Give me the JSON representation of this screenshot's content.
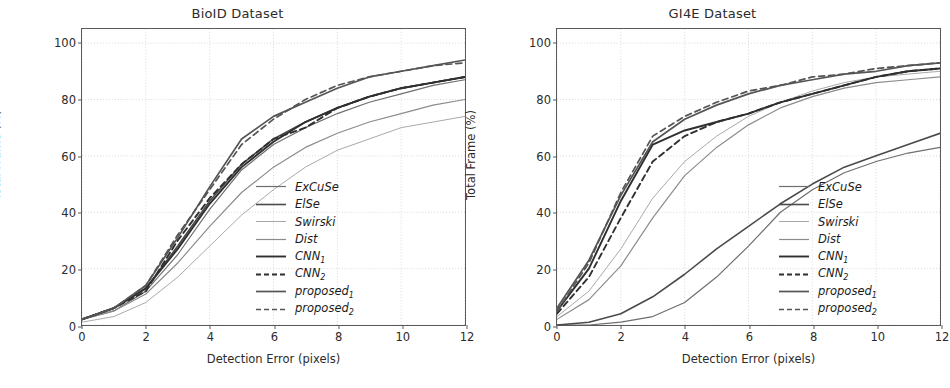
{
  "figure": {
    "width": 950,
    "height": 388,
    "background": "#ffffff"
  },
  "axis": {
    "xlabel": "Detection Error (pixels)",
    "ylabel": "Total Frame (%)",
    "xticks": [
      0,
      2,
      4,
      6,
      8,
      10,
      12
    ],
    "yticks": [
      0,
      20,
      40,
      60,
      80,
      100
    ],
    "xlim": [
      0,
      12
    ],
    "ylim": [
      0,
      105
    ],
    "grid": true,
    "grid_color": "#cfcfcf",
    "axis_color": "#5a5a5a",
    "text_color": "#2b2b2b"
  },
  "legend": {
    "position": "lower right",
    "entries": [
      {
        "label": "ExCuSe",
        "sub": "",
        "style": "solid",
        "color": "#6e6e6e",
        "width": 1.2
      },
      {
        "label": "ElSe",
        "sub": "",
        "style": "solid",
        "color": "#4a4a4a",
        "width": 1.6
      },
      {
        "label": "Swirski",
        "sub": "",
        "style": "solid",
        "color": "#a8a8a8",
        "width": 1.0
      },
      {
        "label": "Dist",
        "sub": "",
        "style": "solid",
        "color": "#8c8c8c",
        "width": 1.2
      },
      {
        "label": "CNN",
        "sub": "1",
        "style": "solid",
        "color": "#2f2f2f",
        "width": 1.9
      },
      {
        "label": "CNN",
        "sub": "2",
        "style": "dashed",
        "color": "#2f2f2f",
        "width": 1.9
      },
      {
        "label": "proposed",
        "sub": "1",
        "style": "solid",
        "color": "#555555",
        "width": 1.7
      },
      {
        "label": "proposed",
        "sub": "2",
        "style": "dashed",
        "color": "#555555",
        "width": 1.7
      }
    ]
  },
  "chart_data": [
    {
      "type": "line",
      "title": "BioID Dataset",
      "xlabel": "Detection Error (pixels)",
      "ylabel": "Total Frame (%)",
      "xlim": [
        0,
        12
      ],
      "ylim": [
        0,
        105
      ],
      "grid": true,
      "legend_position": "lower right",
      "x": [
        0,
        1,
        2,
        3,
        4,
        5,
        6,
        7,
        8,
        9,
        10,
        11,
        12
      ],
      "series": [
        {
          "name": "ExCuSe",
          "values": [
            2,
            5,
            12,
            25,
            41,
            55,
            64,
            70,
            75,
            79,
            82,
            85,
            87
          ]
        },
        {
          "name": "ElSe",
          "values": [
            2,
            6,
            13,
            28,
            44,
            57,
            66,
            72,
            77,
            81,
            84,
            86,
            88
          ]
        },
        {
          "name": "Swirski",
          "values": [
            1,
            3,
            8,
            17,
            28,
            39,
            48,
            56,
            62,
            66,
            70,
            72,
            74
          ]
        },
        {
          "name": "Dist",
          "values": [
            2,
            5,
            11,
            22,
            35,
            47,
            56,
            63,
            68,
            72,
            75,
            78,
            80
          ]
        },
        {
          "name": "CNN1",
          "values": [
            2,
            6,
            13,
            27,
            43,
            56,
            65,
            72,
            77,
            81,
            84,
            86,
            88
          ]
        },
        {
          "name": "CNN2",
          "values": [
            2,
            6,
            12,
            30,
            45,
            57,
            66,
            70,
            77,
            81,
            84,
            86,
            88
          ]
        },
        {
          "name": "proposed1",
          "values": [
            2,
            6,
            14,
            31,
            49,
            66,
            74,
            79,
            84,
            88,
            90,
            92,
            94
          ]
        },
        {
          "name": "proposed2",
          "values": [
            2,
            6,
            14,
            32,
            48,
            64,
            73,
            80,
            85,
            88,
            90,
            92,
            93
          ]
        }
      ]
    },
    {
      "type": "line",
      "title": "GI4E Dataset",
      "xlabel": "Detection Error (pixels)",
      "ylabel": "Total Frame (%)",
      "xlim": [
        0,
        12
      ],
      "ylim": [
        0,
        105
      ],
      "grid": true,
      "legend_position": "lower right",
      "x": [
        0,
        1,
        2,
        3,
        4,
        5,
        6,
        7,
        8,
        9,
        10,
        11,
        12
      ],
      "series": [
        {
          "name": "ExCuSe",
          "values": [
            0,
            0,
            1,
            3,
            8,
            17,
            28,
            40,
            48,
            54,
            58,
            61,
            63
          ]
        },
        {
          "name": "ElSe",
          "values": [
            0,
            1,
            4,
            10,
            18,
            27,
            35,
            43,
            50,
            56,
            60,
            64,
            68
          ]
        },
        {
          "name": "Swirski",
          "values": [
            3,
            12,
            27,
            45,
            58,
            67,
            74,
            79,
            83,
            86,
            88,
            89,
            90
          ]
        },
        {
          "name": "Dist",
          "values": [
            2,
            9,
            21,
            38,
            53,
            63,
            71,
            77,
            81,
            84,
            86,
            87,
            88
          ]
        },
        {
          "name": "CNN1",
          "values": [
            5,
            20,
            44,
            64,
            69,
            72,
            75,
            79,
            82,
            85,
            88,
            90,
            91
          ]
        },
        {
          "name": "CNN2",
          "values": [
            4,
            17,
            38,
            58,
            67,
            72,
            75,
            79,
            82,
            85,
            88,
            90,
            91
          ]
        },
        {
          "name": "proposed1",
          "values": [
            6,
            23,
            46,
            65,
            73,
            78,
            82,
            85,
            87,
            89,
            90,
            92,
            93
          ]
        },
        {
          "name": "proposed2",
          "values": [
            5,
            22,
            47,
            67,
            74,
            79,
            83,
            85,
            88,
            89,
            91,
            92,
            93
          ]
        }
      ]
    }
  ]
}
